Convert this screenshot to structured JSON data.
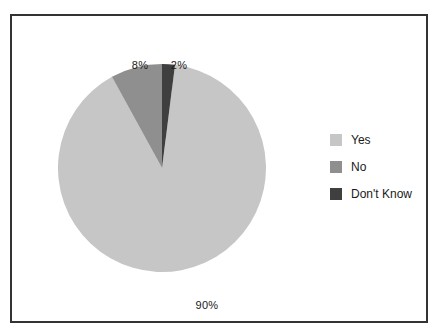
{
  "window": {
    "background_color": "#ffffff",
    "frame_border_color": "#333333",
    "text_color": "#1a1a1a"
  },
  "chart_data": {
    "type": "pie",
    "title": "",
    "categories": [
      "Yes",
      "No",
      "Don't Know"
    ],
    "values": [
      90,
      8,
      2
    ],
    "slices": [
      {
        "label": "Yes",
        "value": 90,
        "pct_label": "90%",
        "color": "#c6c6c6"
      },
      {
        "label": "No",
        "value": 8,
        "pct_label": "8%",
        "color": "#8f8f8f"
      },
      {
        "label": "Don't Know",
        "value": 2,
        "pct_label": "2%",
        "color": "#3f3f3f"
      }
    ],
    "start_angle_deg": 7.2,
    "direction": "clockwise",
    "legend_position": "right",
    "grid": false
  }
}
